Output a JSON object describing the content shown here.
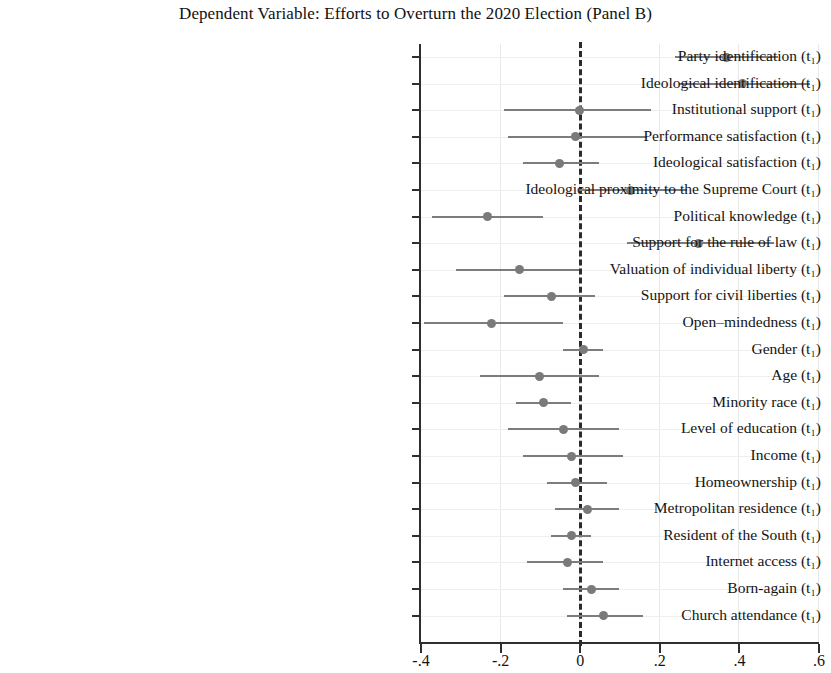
{
  "chart_data": {
    "type": "scatter",
    "title": "Dependent Variable: Efforts to Overturn the 2020 Election (Panel B)",
    "subtitle": "",
    "xlabel": "",
    "ylabel": "",
    "xlim": [
      -0.4,
      0.6
    ],
    "xticks": [
      -0.4,
      -0.2,
      0,
      0.2,
      0.4,
      0.6
    ],
    "xticklabels": [
      "-.4",
      "-.2",
      "0",
      ".2",
      ".4",
      ".6"
    ],
    "grid": true,
    "legend": "none",
    "reference_line": 0,
    "reference_line_style": "dashed",
    "orientation": "horizontal",
    "marker_color": "#7a7a7a",
    "ci_color": "#7c7c7c",
    "categories": [
      "Party identification (t₁)",
      "Ideological identification (t₁)",
      "Institutional support (t₁)",
      "Performance satisfaction (t₁)",
      "Ideological satisfaction (t₁)",
      "Ideological proximity to the Supreme Court (t₁)",
      "Political knowledge (t₁)",
      "Support for the rule of law (t₁)",
      "Valuation of individual liberty (t₁)",
      "Support for civil liberties (t₁)",
      "Open–mindedness (t₁)",
      "Gender (t₁)",
      "Age (t₁)",
      "Minority race (t₁)",
      "Level of education (t₁)",
      "Income (t₁)",
      "Homeownership (t₁)",
      "Metropolitan residence (t₁)",
      "Resident of the South (t₁)",
      "Internet access (t₁)",
      "Born-again (t₁)",
      "Church attendance (t₁)"
    ],
    "points": [
      {
        "label": "Party identification (t₁)",
        "estimate": 0.37,
        "ci_low": 0.24,
        "ci_high": 0.5
      },
      {
        "label": "Ideological identification (t₁)",
        "estimate": 0.41,
        "ci_low": 0.25,
        "ci_high": 0.58
      },
      {
        "label": "Institutional support (t₁)",
        "estimate": 0.0,
        "ci_low": -0.19,
        "ci_high": 0.18
      },
      {
        "label": "Performance satisfaction (t₁)",
        "estimate": -0.01,
        "ci_low": -0.18,
        "ci_high": 0.17
      },
      {
        "label": "Ideological satisfaction (t₁)",
        "estimate": -0.05,
        "ci_low": -0.14,
        "ci_high": 0.05
      },
      {
        "label": "Ideological proximity to the Supreme Court (t₁)",
        "estimate": 0.13,
        "ci_low": 0.0,
        "ci_high": 0.27
      },
      {
        "label": "Political knowledge (t₁)",
        "estimate": -0.23,
        "ci_low": -0.37,
        "ci_high": -0.09
      },
      {
        "label": "Support for the rule of law (t₁)",
        "estimate": 0.3,
        "ci_low": 0.12,
        "ci_high": 0.49
      },
      {
        "label": "Valuation of individual liberty (t₁)",
        "estimate": -0.15,
        "ci_low": -0.31,
        "ci_high": 0.0
      },
      {
        "label": "Support for civil liberties (t₁)",
        "estimate": -0.07,
        "ci_low": -0.19,
        "ci_high": 0.04
      },
      {
        "label": "Open–mindedness (t₁)",
        "estimate": -0.22,
        "ci_low": -0.39,
        "ci_high": -0.04
      },
      {
        "label": "Gender (t₁)",
        "estimate": 0.01,
        "ci_low": -0.04,
        "ci_high": 0.06
      },
      {
        "label": "Age (t₁)",
        "estimate": -0.1,
        "ci_low": -0.25,
        "ci_high": 0.05
      },
      {
        "label": "Minority race (t₁)",
        "estimate": -0.09,
        "ci_low": -0.16,
        "ci_high": -0.02
      },
      {
        "label": "Level of education (t₁)",
        "estimate": -0.04,
        "ci_low": -0.18,
        "ci_high": 0.1
      },
      {
        "label": "Income (t₁)",
        "estimate": -0.02,
        "ci_low": -0.14,
        "ci_high": 0.11
      },
      {
        "label": "Homeownership (t₁)",
        "estimate": -0.01,
        "ci_low": -0.08,
        "ci_high": 0.07
      },
      {
        "label": "Metropolitan residence (t₁)",
        "estimate": 0.02,
        "ci_low": -0.06,
        "ci_high": 0.1
      },
      {
        "label": "Resident of the South (t₁)",
        "estimate": -0.02,
        "ci_low": -0.07,
        "ci_high": 0.03
      },
      {
        "label": "Internet access (t₁)",
        "estimate": -0.03,
        "ci_low": -0.13,
        "ci_high": 0.06
      },
      {
        "label": "Born-again (t₁)",
        "estimate": 0.03,
        "ci_low": -0.04,
        "ci_high": 0.1
      },
      {
        "label": "Church attendance (t₁)",
        "estimate": 0.06,
        "ci_low": -0.03,
        "ci_high": 0.16
      }
    ]
  }
}
